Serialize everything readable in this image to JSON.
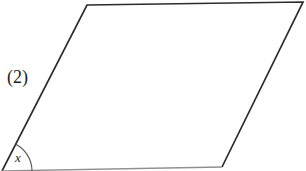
{
  "figure": {
    "label": "(2)",
    "angle_label": "x"
  },
  "shape": {
    "type": "parallelogram",
    "vertices": {
      "top_left": [
        87,
        5
      ],
      "top_right": [
        303,
        2
      ],
      "bottom_right": [
        222,
        167
      ],
      "bottom_left": [
        2,
        171
      ]
    },
    "outline_path": "M 2 171 L 87 5 L 303 2 L 222 167",
    "bottom_edge_path": "M 222 167 L 2 171",
    "angle_arc_path": "M 15.7 144.3 A 30 30 0 0 1 32 170.5",
    "ink_color": "#2b2b2b",
    "bottom_edge_color": "#8f8f8f",
    "arc_color": "#4d4d4d",
    "background": "#ffffff"
  }
}
